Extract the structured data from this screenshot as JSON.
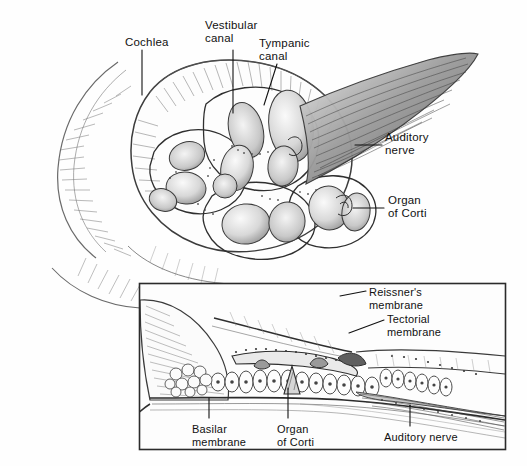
{
  "figure": {
    "ink_color": "#2b2b2b",
    "paper_color": "#fefefe",
    "leader_color": "#111111"
  },
  "main_labels": [
    {
      "id": "cochlea",
      "text": "Cochlea",
      "x": 125,
      "y": 36
    },
    {
      "id": "vestibular",
      "text": "Vestibular\ncanal",
      "x": 205,
      "y": 19
    },
    {
      "id": "tympanic",
      "text": "Tympanic\ncanal",
      "x": 259,
      "y": 37
    },
    {
      "id": "auditory-nerve",
      "text": "Auditory\nnerve",
      "x": 385,
      "y": 131
    },
    {
      "id": "organ-of-corti",
      "text": "Organ\nof Corti",
      "x": 388,
      "y": 194
    }
  ],
  "inset_labels": [
    {
      "id": "reissners",
      "text": "Reissner's\nmembrane",
      "x": 369,
      "y": 286
    },
    {
      "id": "tectorial",
      "text": "Tectorial\nmembrane",
      "x": 387,
      "y": 313
    },
    {
      "id": "basilar",
      "text": "Basilar\nmembrane",
      "x": 192,
      "y": 423
    },
    {
      "id": "organ-of-corti-2",
      "text": "Organ\nof Corti",
      "x": 277,
      "y": 423
    },
    {
      "id": "auditory-nerve-2",
      "text": "Auditory nerve",
      "x": 384,
      "y": 431
    }
  ],
  "inset_frame": {
    "x": 139,
    "y": 283,
    "width": 367,
    "height": 167
  },
  "leaders": [
    {
      "id": "cochlea-leader",
      "points": "142,50 142,95"
    },
    {
      "id": "vestibular-leader",
      "points": "233,50 233,113"
    },
    {
      "id": "tympanic-leader",
      "points": "277,64 264,105"
    },
    {
      "id": "auditory-nerve-leader",
      "points": "355,145 382,145"
    },
    {
      "id": "organ-corti-leader",
      "points": "353,208 384,208"
    },
    {
      "id": "reissners-leader",
      "points": "340,296 366,291"
    },
    {
      "id": "tectorial-leader",
      "points": "349,333 384,320"
    },
    {
      "id": "basilar-leader",
      "points": "209,418 209,398"
    },
    {
      "id": "organ-corti2-leader",
      "points": "288,418 288,388"
    },
    {
      "id": "auditory-nerve2-leader",
      "points": "410,426 410,405"
    }
  ]
}
